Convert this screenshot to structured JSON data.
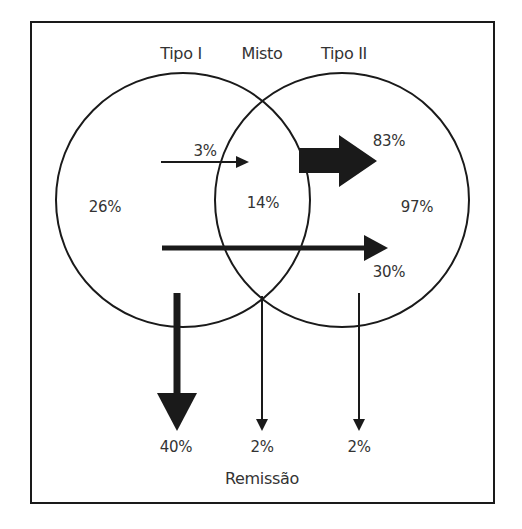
{
  "diagram": {
    "headers": {
      "tipo1": "Tipo I",
      "misto": "Misto",
      "tipo2": "Tipo II"
    },
    "regions": {
      "tipo1_only": "26%",
      "overlap": "14%",
      "tipo2_only": "97%"
    },
    "flows": {
      "tipo1_to_misto": "3%",
      "misto_to_tipo2": "83%",
      "tipo1_to_tipo2": "30%",
      "tipo1_remission": "40%",
      "misto_remission": "2%",
      "tipo2_remission": "2%"
    },
    "footer": "Remissão",
    "colors": {
      "stroke": "#1a1a1a",
      "text": "#333333",
      "background": "#ffffff"
    }
  }
}
